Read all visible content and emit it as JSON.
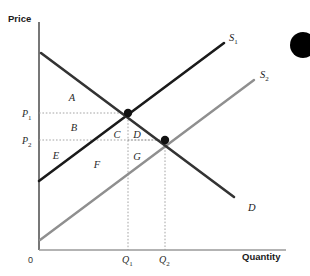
{
  "figure": {
    "kind": "supply-demand-diagram",
    "background_color": "#ffffff"
  },
  "axes": {
    "y_title": "Price",
    "x_title": "Quantity",
    "origin_label": "0",
    "axis_color": "#8a8a8a",
    "y_axis_color": "#555555"
  },
  "price_ticks": [
    {
      "id": "p1",
      "base": "P",
      "sub": "1",
      "y_px": 113
    },
    {
      "id": "p2",
      "base": "P",
      "sub": "2",
      "y_px": 140
    }
  ],
  "quantity_ticks": [
    {
      "id": "q1",
      "base": "Q",
      "sub": "1",
      "x_px": 128
    },
    {
      "id": "q2",
      "base": "Q",
      "sub": "2",
      "x_px": 165
    }
  ],
  "curves": [
    {
      "id": "supply-1",
      "base": "S",
      "sub": "1",
      "color": "#1a1a1a",
      "width": 2.6,
      "label_x": 229,
      "label_y": 41,
      "x1": 39,
      "y1": 181,
      "x2": 224,
      "y2": 43
    },
    {
      "id": "supply-2",
      "base": "S",
      "sub": "2",
      "color": "#8f8f8f",
      "width": 2.4,
      "label_x": 260,
      "label_y": 78,
      "x1": 40,
      "y1": 240,
      "x2": 254,
      "y2": 80
    },
    {
      "id": "demand",
      "base": "D",
      "sub": "",
      "color": "#333333",
      "width": 2.6,
      "label_x": 248,
      "label_y": 211,
      "x1": 41,
      "y1": 53,
      "x2": 234,
      "y2": 197
    }
  ],
  "equilibria": [
    {
      "id": "e1",
      "x_px": 128,
      "y_px": 113,
      "r": 4.2,
      "color": "#111111"
    },
    {
      "id": "e2",
      "x_px": 165,
      "y_px": 140,
      "r": 4.2,
      "color": "#111111"
    }
  ],
  "regions": [
    {
      "id": "A",
      "label": "A",
      "x_px": 72,
      "y_px": 101
    },
    {
      "id": "B",
      "label": "B",
      "x_px": 74,
      "y_px": 131
    },
    {
      "id": "C",
      "label": "C",
      "x_px": 117,
      "y_px": 138
    },
    {
      "id": "D",
      "label": "D",
      "x_px": 137,
      "y_px": 138
    },
    {
      "id": "E",
      "label": "E",
      "x_px": 56,
      "y_px": 159
    },
    {
      "id": "F",
      "label": "F",
      "x_px": 97,
      "y_px": 168
    },
    {
      "id": "G",
      "label": "G",
      "x_px": 137,
      "y_px": 160
    }
  ],
  "guides": {
    "color": "#9a9a9a",
    "dash": "1.6,1.8",
    "lines": [
      {
        "id": "p1-h",
        "x1": 39,
        "y1": 113,
        "x2": 128,
        "y2": 113
      },
      {
        "id": "p2-h",
        "x1": 39,
        "y1": 140,
        "x2": 165,
        "y2": 140
      },
      {
        "id": "q1-v",
        "x1": 128,
        "y1": 113,
        "x2": 128,
        "y2": 250
      },
      {
        "id": "q2-v",
        "x1": 165,
        "y1": 140,
        "x2": 165,
        "y2": 250
      },
      {
        "id": "p2-c-h",
        "x1": 128,
        "y1": 140,
        "x2": 165,
        "y2": 140
      }
    ]
  },
  "decoration": {
    "corner_dot": {
      "cx": 303,
      "cy": 45,
      "r": 13,
      "color": "#000000"
    }
  },
  "chart_data": {
    "type": "line",
    "title": "",
    "xlabel": "Quantity",
    "ylabel": "Price",
    "series": [
      {
        "name": "S1",
        "description": "Original upward-sloping supply curve"
      },
      {
        "name": "S2",
        "description": "Shifted-right (lower) supply curve"
      },
      {
        "name": "D",
        "description": "Downward-sloping demand curve"
      }
    ],
    "equilibrium_points": [
      {
        "name": "E1",
        "price": "P1",
        "quantity": "Q1"
      },
      {
        "name": "E2",
        "price": "P2",
        "quantity": "Q2"
      }
    ],
    "surplus_regions": [
      "A",
      "B",
      "C",
      "D",
      "E",
      "F",
      "G"
    ],
    "grid": false,
    "legend": "inline-curve-labels"
  }
}
